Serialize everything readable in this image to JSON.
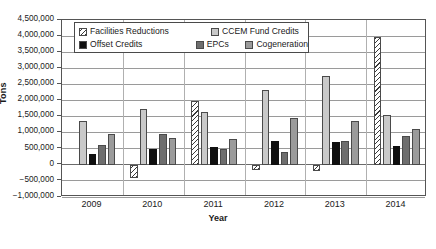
{
  "chart_data": {
    "type": "bar",
    "title": "",
    "xlabel": "Year",
    "ylabel": "Tons",
    "categories": [
      "2009",
      "2010",
      "2011",
      "2012",
      "2013",
      "2014"
    ],
    "ylim": [
      -1000000,
      4500000
    ],
    "ytick_step": 500000,
    "ytick_labels": [
      "4,500,000",
      "4,000,000",
      "3,500,000",
      "3,000,000",
      "2,500,000",
      "2,000,000",
      "1,500,000",
      "1,000,000",
      "500,000",
      "0",
      "−500,000",
      "−1,000,000"
    ],
    "ytick_values": [
      4500000,
      4000000,
      3500000,
      3000000,
      2500000,
      2000000,
      1500000,
      1000000,
      500000,
      0,
      -500000,
      -1000000
    ],
    "grid": true,
    "legend_position": "upper-left-inside",
    "series": [
      {
        "name": "Facilities Reductions",
        "fill": "hatch",
        "color": "#ffffff",
        "values": [
          0,
          -400000,
          1975000,
          -150000,
          -200000,
          3960000
        ]
      },
      {
        "name": "CCEM Fund Credits",
        "fill": "lightgray",
        "color": "#c9c9c9",
        "values": [
          1360000,
          1750000,
          1640000,
          2340000,
          2750000,
          1550000
        ]
      },
      {
        "name": "Offset Credits",
        "fill": "black",
        "color": "#101010",
        "values": [
          340000,
          480000,
          550000,
          730000,
          700000,
          580000
        ]
      },
      {
        "name": "EPCs",
        "fill": "darkgray",
        "color": "#6e6e6e",
        "values": [
          630000,
          970000,
          480000,
          410000,
          730000,
          890000
        ]
      },
      {
        "name": "Cogeneration",
        "fill": "midgray",
        "color": "#9b9b9b",
        "values": [
          950000,
          820000,
          810000,
          1450000,
          1360000,
          1120000
        ]
      }
    ]
  }
}
